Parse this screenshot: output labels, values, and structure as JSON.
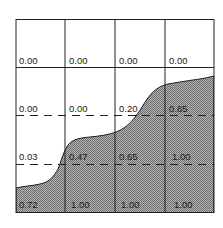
{
  "diagram": {
    "type": "volume-fraction-grid",
    "rows": 4,
    "cols": 4,
    "cells": [
      [
        "0.00",
        "0.00",
        "0.00",
        "0.00"
      ],
      [
        "0.00",
        "0.00",
        "0.20",
        "0.85"
      ],
      [
        "0.03",
        "0.47",
        "0.65",
        "1.00"
      ],
      [
        "0.72",
        "1.00",
        "1.00",
        "1.00"
      ]
    ],
    "line_styles": {
      "top_border": "solid",
      "row_line_1": "solid",
      "row_line_2": "dashed",
      "row_line_3": "dashed",
      "bottom_border": "solid"
    },
    "colors": {
      "background": "#ffffff",
      "grid_line": "#222222",
      "fill_dark": "#6e6e6e",
      "fill_light": "#b4b4b4",
      "interface_line": "#1a1a1a",
      "text": "#1a1a1a"
    }
  }
}
